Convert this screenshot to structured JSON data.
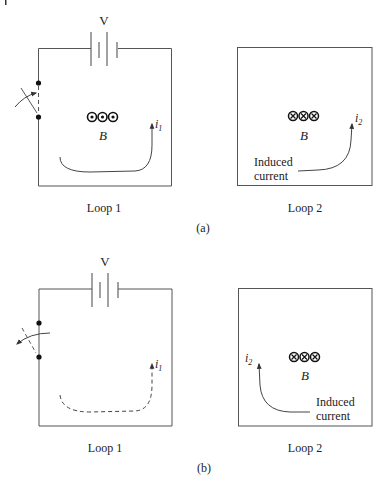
{
  "figure": {
    "panels": [
      {
        "id": "a",
        "caption": "(a)",
        "loop1": {
          "label": "Loop 1",
          "battery_label": "V",
          "switch_state": "closing",
          "field_symbol": "dots",
          "field_label": "B",
          "current_label": "i",
          "current_subscript": "1",
          "current_style": "solid"
        },
        "loop2": {
          "label": "Loop 2",
          "field_symbol": "crosses",
          "field_label": "B",
          "current_label": "i",
          "current_subscript": "2",
          "induced_text_1": "Induced",
          "induced_text_2": "current",
          "induced_direction": "right-side-up"
        }
      },
      {
        "id": "b",
        "caption": "(b)",
        "loop1": {
          "label": "Loop 1",
          "battery_label": "V",
          "switch_state": "opening",
          "field_symbol": "none",
          "current_label": "i",
          "current_subscript": "1",
          "current_style": "dashed"
        },
        "loop2": {
          "label": "Loop 2",
          "field_symbol": "crosses",
          "field_label": "B",
          "current_label": "i",
          "current_subscript": "2",
          "induced_text_1": "Induced",
          "induced_text_2": "current",
          "induced_direction": "left-side-up"
        }
      }
    ],
    "colors": {
      "line": "#555555",
      "text": "#222222",
      "background": "#ffffff"
    }
  }
}
